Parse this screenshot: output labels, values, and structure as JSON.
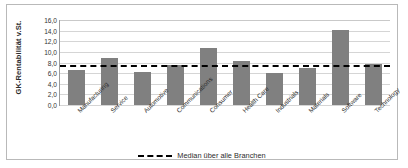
{
  "chart_data": {
    "type": "bar",
    "title": "",
    "xlabel": "",
    "ylabel": "GK-Rentabilität v.St.",
    "ylim": [
      0,
      16
    ],
    "ytick_step": 2,
    "grid": true,
    "legend_position": "bottom",
    "categories": [
      "Manufacturing",
      "Service",
      "Automotive",
      "Communications",
      "Consumer",
      "Health Care",
      "Industrials",
      "Materials",
      "Software",
      "Technology"
    ],
    "values": [
      6.6,
      8.8,
      6.2,
      7.6,
      10.8,
      8.3,
      6.0,
      7.0,
      14.2,
      7.7
    ],
    "ytick_labels": [
      "0,0",
      "2,0",
      "4,0",
      "6,0",
      "8,0",
      "10,0",
      "12,0",
      "14,0",
      "16,0"
    ],
    "reference_line": {
      "label": "Median über alle Branchen",
      "value": 7.6,
      "style": "dashed",
      "color": "#000000"
    },
    "series": [
      {
        "name": "GK-Rentabilität v.St.",
        "color": "#808080",
        "values": [
          6.6,
          8.8,
          6.2,
          7.6,
          10.8,
          8.3,
          6.0,
          7.0,
          14.2,
          7.7
        ]
      }
    ]
  },
  "colors": {
    "bar": "#808080",
    "grid": "#d5d5d5",
    "axis": "#9a9a9a",
    "frame": "#b9b9b9",
    "text": "#2b2b2b",
    "median": "#000000"
  }
}
